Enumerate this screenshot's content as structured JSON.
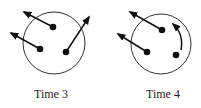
{
  "panels": [
    {
      "label": "Time 3",
      "circle": {
        "cx": 54,
        "cy": 43,
        "r": 31
      },
      "particles": [
        {
          "x": 53,
          "y": 27,
          "arrow": {
            "type": "straight",
            "to": [
              24,
              12
            ]
          }
        },
        {
          "x": 40,
          "y": 49,
          "arrow": {
            "type": "straight",
            "to": [
              11,
              33
            ]
          }
        },
        {
          "x": 66,
          "y": 52,
          "arrow": {
            "type": "straight",
            "to": [
              89,
              17
            ]
          }
        }
      ]
    },
    {
      "label": "Time 4",
      "circle": {
        "cx": 161,
        "cy": 44,
        "r": 30
      },
      "particles": [
        {
          "x": 162,
          "y": 30,
          "arrow": {
            "type": "straight",
            "to": [
              130,
              12
            ]
          }
        },
        {
          "x": 147,
          "y": 52,
          "arrow": {
            "type": "straight",
            "to": [
              118,
              34
            ]
          }
        },
        {
          "x": 176,
          "y": 55,
          "arrow": {
            "type": "curved",
            "from": [
              182,
              50
            ],
            "to": [
              173,
              24
            ]
          }
        }
      ]
    }
  ],
  "colors": {
    "stroke": "#333333",
    "dot": "#111111"
  }
}
